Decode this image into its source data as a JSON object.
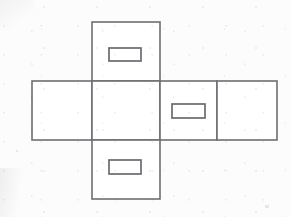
{
  "document": {
    "title": "Cube Net Diagram",
    "description": "Unfolded box net drawn as line art: a cross of six rectangular faces with three small rectangular slots",
    "background_color": "#fcfcfc",
    "line_color": "#6e6e73",
    "face_fill_color": "#ffffff",
    "canvas": {
      "width": 290,
      "height": 217
    }
  },
  "diagram": {
    "type": "cube-net",
    "stroke_width": 1.6,
    "faces": [
      {
        "id": "top-face",
        "name": "top face",
        "x": 92,
        "y": 22,
        "width": 68,
        "height": 59
      },
      {
        "id": "left-face",
        "name": "left face",
        "x": 32,
        "y": 81,
        "width": 60,
        "height": 59
      },
      {
        "id": "center-face",
        "name": "center face",
        "x": 92,
        "y": 81,
        "width": 68,
        "height": 59
      },
      {
        "id": "right-inner-face",
        "name": "right inner face",
        "x": 160,
        "y": 81,
        "width": 57,
        "height": 59
      },
      {
        "id": "right-outer-face",
        "name": "right outer face",
        "x": 217,
        "y": 81,
        "width": 60,
        "height": 59
      },
      {
        "id": "bottom-face",
        "name": "bottom face",
        "x": 92,
        "y": 140,
        "width": 68,
        "height": 59
      }
    ],
    "slots": [
      {
        "id": "top-slot",
        "name": "top slot",
        "parent_face": "top-face",
        "x": 109,
        "y": 48,
        "width": 32,
        "height": 13
      },
      {
        "id": "middle-slot",
        "name": "middle slot",
        "parent_face": "right-inner-face",
        "x": 172,
        "y": 104,
        "width": 33,
        "height": 14
      },
      {
        "id": "bottom-slot",
        "name": "bottom slot",
        "parent_face": "bottom-face",
        "x": 109,
        "y": 160,
        "width": 32,
        "height": 14
      }
    ],
    "labels": []
  }
}
